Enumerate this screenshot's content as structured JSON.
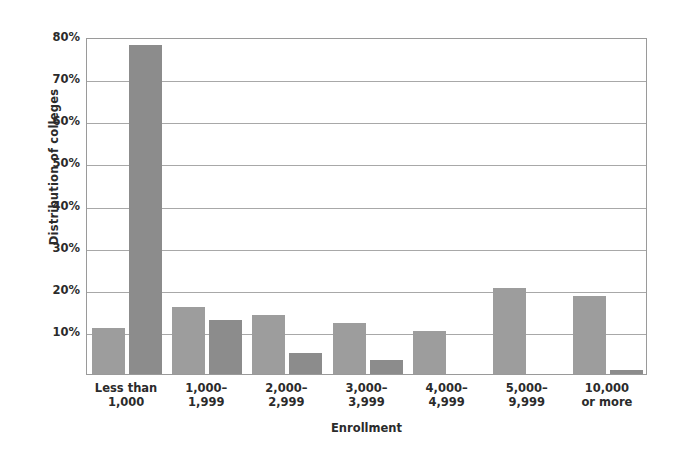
{
  "chart_data": {
    "type": "bar",
    "title": "",
    "xlabel": "Enrollment",
    "ylabel": "Distribution of colleges",
    "categories": [
      "Less than\n1,000",
      "1,000–\n1,999",
      "2,000–\n2,999",
      "3,000–\n3,999",
      "4,000–\n4,999",
      "5,000–\n9,999",
      "10,000\nor more"
    ],
    "category_lines": [
      [
        "Less than",
        "1,000"
      ],
      [
        "1,000–",
        "1,999"
      ],
      [
        "2,000–",
        "2,999"
      ],
      [
        "3,000–",
        "3,999"
      ],
      [
        "4,000–",
        "4,999"
      ],
      [
        "5,000–",
        "9,999"
      ],
      [
        "10,000",
        "or more"
      ]
    ],
    "series": [
      {
        "name": "Series 1",
        "color": "#9d9d9d",
        "values": [
          11.0,
          16.0,
          14.1,
          12.2,
          10.3,
          20.5,
          18.6
        ]
      },
      {
        "name": "Series 2",
        "color": "#8c8c8c",
        "values": [
          78.0,
          12.9,
          5.1,
          3.3,
          0.0,
          0.0,
          1.0
        ]
      }
    ],
    "ylim": [
      0,
      80
    ],
    "yticks": [
      10,
      20,
      30,
      40,
      50,
      60,
      70,
      80
    ],
    "ytick_labels": [
      "10%",
      "20%",
      "30%",
      "40%",
      "50%",
      "60%",
      "70%",
      "80%"
    ],
    "grid": true,
    "legend": "none",
    "axis_color": "#9a9a9a",
    "grid_color": "#a8a8a8",
    "text_color": "#2b2b2b",
    "background": "#ffffff"
  }
}
